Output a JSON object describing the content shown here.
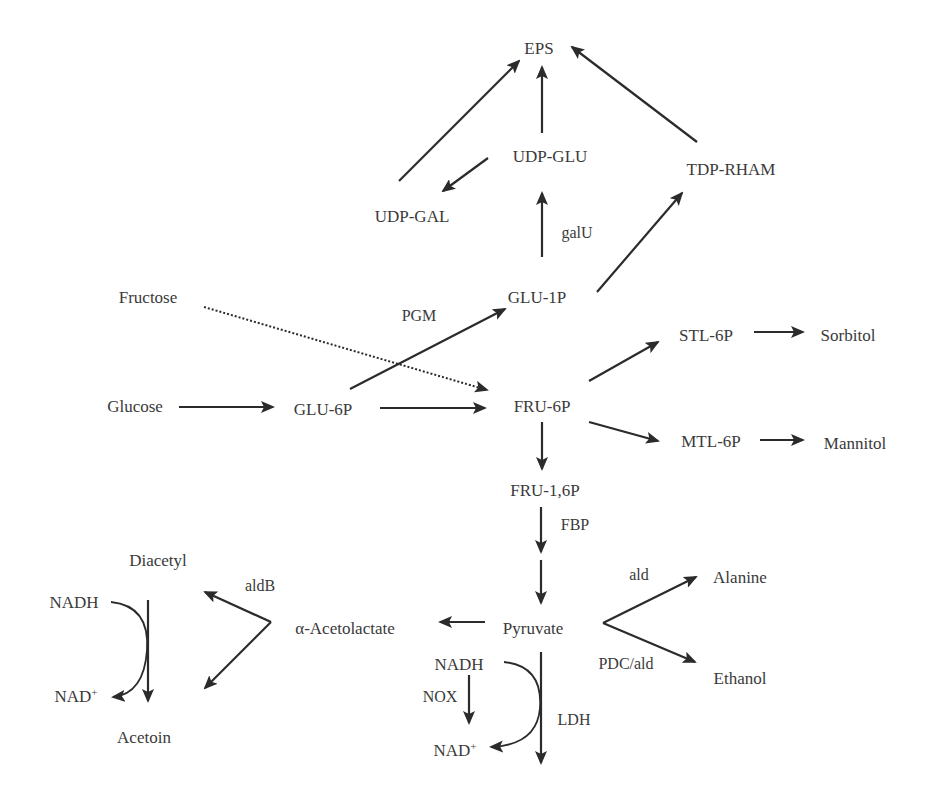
{
  "diagram": {
    "type": "metabolic-pathway",
    "stroke_color": "#2b2b2b",
    "text_color": "#3a3a3a",
    "metabolites": [
      {
        "id": "eps",
        "label": "EPS",
        "x": 539,
        "y": 48
      },
      {
        "id": "udp_glu",
        "label": "UDP-GLU",
        "x": 550,
        "y": 156
      },
      {
        "id": "tdp_rham",
        "label": "TDP-RHAM",
        "x": 731,
        "y": 169
      },
      {
        "id": "udp_gal",
        "label": "UDP-GAL",
        "x": 412,
        "y": 216
      },
      {
        "id": "glu_1p",
        "label": "GLU-1P",
        "x": 537,
        "y": 297
      },
      {
        "id": "fructose",
        "label": "Fructose",
        "x": 148,
        "y": 297
      },
      {
        "id": "stl_6p",
        "label": "STL-6P",
        "x": 706,
        "y": 335
      },
      {
        "id": "sorbitol",
        "label": "Sorbitol",
        "x": 848,
        "y": 335
      },
      {
        "id": "glucose",
        "label": "Glucose",
        "x": 135,
        "y": 406
      },
      {
        "id": "glu_6p",
        "label": "GLU-6P",
        "x": 323,
        "y": 409
      },
      {
        "id": "fru_6p",
        "label": "FRU-6P",
        "x": 542,
        "y": 406
      },
      {
        "id": "mtl_6p",
        "label": "MTL-6P",
        "x": 711,
        "y": 441
      },
      {
        "id": "mannitol",
        "label": "Mannitol",
        "x": 855,
        "y": 443
      },
      {
        "id": "fru_16p",
        "label": "FRU-1,6P",
        "x": 545,
        "y": 490
      },
      {
        "id": "diacetyl",
        "label": "Diacetyl",
        "x": 158,
        "y": 560
      },
      {
        "id": "alanine",
        "label": "Alanine",
        "x": 740,
        "y": 577
      },
      {
        "id": "nadh_left",
        "label": "NADH",
        "x": 74,
        "y": 602
      },
      {
        "id": "acetolactate",
        "label": "α-Acetolactate",
        "x": 345,
        "y": 628
      },
      {
        "id": "pyruvate",
        "label": "Pyruvate",
        "x": 533,
        "y": 628
      },
      {
        "id": "nadh_right",
        "label": "NADH",
        "x": 459,
        "y": 664
      },
      {
        "id": "ethanol",
        "label": "Ethanol",
        "x": 740,
        "y": 678
      },
      {
        "id": "nad_left",
        "label": "NAD",
        "sup": "+",
        "x": 76,
        "y": 696
      },
      {
        "id": "acetoin",
        "label": "Acetoin",
        "x": 144,
        "y": 737
      },
      {
        "id": "nad_right",
        "label": "NAD",
        "sup": "+",
        "x": 455,
        "y": 750
      }
    ],
    "enzymes": [
      {
        "id": "galu",
        "label": "galU",
        "x": 577,
        "y": 233
      },
      {
        "id": "pgm",
        "label": "PGM",
        "x": 419,
        "y": 316
      },
      {
        "id": "fbp",
        "label": "FBP",
        "x": 575,
        "y": 525
      },
      {
        "id": "ald",
        "label": "ald",
        "x": 639,
        "y": 575
      },
      {
        "id": "aldb",
        "label": "aldB",
        "x": 260,
        "y": 586
      },
      {
        "id": "pdc_ald",
        "label": "PDC/ald",
        "x": 626,
        "y": 664
      },
      {
        "id": "nox",
        "label": "NOX",
        "x": 440,
        "y": 697
      },
      {
        "id": "ldh",
        "label": "LDH",
        "x": 574,
        "y": 720
      }
    ],
    "edges": [
      {
        "id": "udpgal-eps",
        "from": "UDP-GAL",
        "to": "EPS",
        "x1": 399,
        "y1": 181,
        "x2": 519,
        "y2": 61,
        "style": "solid"
      },
      {
        "id": "udpglu-eps",
        "from": "UDP-GLU",
        "to": "EPS",
        "x1": 542,
        "y1": 133,
        "x2": 542,
        "y2": 67,
        "style": "solid"
      },
      {
        "id": "tdprham-eps",
        "from": "TDP-RHAM",
        "to": "EPS",
        "x1": 697,
        "y1": 142,
        "x2": 572,
        "y2": 47,
        "style": "solid"
      },
      {
        "id": "udpglu-udpgal",
        "from": "UDP-GLU",
        "to": "UDP-GAL",
        "x1": 488,
        "y1": 158,
        "x2": 443,
        "y2": 191,
        "style": "solid"
      },
      {
        "id": "glu1p-udpglu",
        "from": "GLU-1P",
        "to": "UDP-GLU",
        "enzyme": "galU",
        "x1": 542,
        "y1": 257,
        "x2": 542,
        "y2": 193,
        "style": "solid"
      },
      {
        "id": "glu1p-tdprham",
        "from": "GLU-1P",
        "to": "TDP-RHAM",
        "x1": 597,
        "y1": 292,
        "x2": 682,
        "y2": 193,
        "style": "solid"
      },
      {
        "id": "glu6p-glu1p",
        "from": "GLU-6P",
        "to": "GLU-1P",
        "enzyme": "PGM",
        "x1": 350,
        "y1": 389,
        "x2": 505,
        "y2": 309,
        "style": "solid"
      },
      {
        "id": "fructose-fru6p",
        "from": "Fructose",
        "to": "FRU-6P",
        "x1": 204,
        "y1": 307,
        "x2": 487,
        "y2": 390,
        "style": "dotted"
      },
      {
        "id": "glucose-glu6p",
        "from": "Glucose",
        "to": "GLU-6P",
        "x1": 179,
        "y1": 407,
        "x2": 273,
        "y2": 407,
        "style": "solid"
      },
      {
        "id": "glu6p-fru6p",
        "from": "GLU-6P",
        "to": "FRU-6P",
        "x1": 380,
        "y1": 408,
        "x2": 485,
        "y2": 408,
        "style": "solid"
      },
      {
        "id": "fru6p-stl6p",
        "from": "FRU-6P",
        "to": "STL-6P",
        "x1": 589,
        "y1": 381,
        "x2": 658,
        "y2": 342,
        "style": "solid"
      },
      {
        "id": "stl6p-sorbitol",
        "from": "STL-6P",
        "to": "Sorbitol",
        "x1": 754,
        "y1": 332,
        "x2": 803,
        "y2": 332,
        "style": "solid"
      },
      {
        "id": "fru6p-mtl6p",
        "from": "FRU-6P",
        "to": "MTL-6P",
        "x1": 589,
        "y1": 422,
        "x2": 658,
        "y2": 441,
        "style": "solid"
      },
      {
        "id": "mtl6p-mannitol",
        "from": "MTL-6P",
        "to": "Mannitol",
        "x1": 760,
        "y1": 440,
        "x2": 803,
        "y2": 440,
        "style": "solid"
      },
      {
        "id": "fru6p-fru16p",
        "from": "FRU-6P",
        "to": "FRU-1,6P",
        "x1": 542,
        "y1": 422,
        "x2": 542,
        "y2": 469,
        "style": "solid"
      },
      {
        "id": "fru16p-fbp",
        "from": "FRU-1,6P",
        "to": "(next)",
        "enzyme": "FBP",
        "x1": 541,
        "y1": 507,
        "x2": 541,
        "y2": 552,
        "style": "solid"
      },
      {
        "id": "to-pyruvate",
        "from": "(prev)",
        "to": "Pyruvate",
        "x1": 541,
        "y1": 560,
        "x2": 541,
        "y2": 603,
        "style": "solid"
      },
      {
        "id": "pyruvate-acetolactate",
        "from": "Pyruvate",
        "to": "α-Acetolactate",
        "x1": 485,
        "y1": 622,
        "x2": 440,
        "y2": 622,
        "style": "solid"
      },
      {
        "id": "pyruvate-alanine",
        "from": "Pyruvate",
        "to": "Alanine",
        "enzyme": "ald",
        "x1": 603,
        "y1": 623,
        "x2": 696,
        "y2": 577,
        "style": "solid"
      },
      {
        "id": "pyruvate-ethanol",
        "from": "Pyruvate",
        "to": "Ethanol",
        "enzyme": "PDC/ald",
        "x1": 603,
        "y1": 623,
        "x2": 695,
        "y2": 662,
        "style": "solid"
      },
      {
        "id": "acetolactate-diacetyl",
        "from": "α-Acetolactate",
        "to": "Diacetyl",
        "enzyme": "aldB",
        "x1": 271,
        "y1": 622,
        "x2": 205,
        "y2": 592,
        "style": "solid"
      },
      {
        "id": "acetolactate-acetoin",
        "from": "α-Acetolactate",
        "to": "Acetoin",
        "x1": 271,
        "y1": 622,
        "x2": 205,
        "y2": 688,
        "style": "solid"
      },
      {
        "id": "diacetyl-acetoin",
        "from": "Diacetyl",
        "to": "Acetoin",
        "x1": 148,
        "y1": 600,
        "x2": 148,
        "y2": 701,
        "style": "solid"
      },
      {
        "id": "nadh-nad-nox",
        "from": "NADH",
        "to": "NAD+",
        "enzyme": "NOX",
        "x1": 469,
        "y1": 675,
        "x2": 469,
        "y2": 723,
        "style": "solid"
      },
      {
        "id": "pyruvate-lactate-ldh",
        "from": "Pyruvate",
        "to": "(lactate)",
        "enzyme": "LDH",
        "x1": 541,
        "y1": 652,
        "x2": 541,
        "y2": 763,
        "style": "solid"
      }
    ],
    "cofactor_curves": [
      {
        "id": "curve-left",
        "from": "NADH",
        "to": "NAD+",
        "d": "M 111 602 Q 150 606 147 650 Q 144 694 113 697"
      },
      {
        "id": "curve-right",
        "from": "NADH",
        "to": "NAD+",
        "d": "M 504 662 Q 543 666 540 708 Q 537 745 491 747"
      }
    ]
  }
}
